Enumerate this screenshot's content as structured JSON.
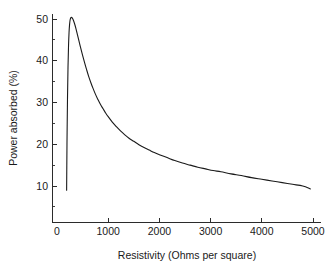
{
  "chart_data": {
    "type": "line",
    "title": "",
    "xlabel": "Resistivity (Ohms per square)",
    "ylabel": "Power absorbed (%)",
    "xlim": [
      0,
      5000
    ],
    "ylim": [
      0,
      53
    ],
    "grid": false,
    "legend": null,
    "xticks": [
      0,
      1000,
      2000,
      3000,
      4000,
      5000
    ],
    "xtick_labels": [
      "0",
      "1000",
      "2000",
      "3000",
      "4000",
      "5000"
    ],
    "xminor_step": 500,
    "yticks": [
      10,
      20,
      30,
      40,
      50
    ],
    "ytick_labels": [
      "10",
      "20",
      "30",
      "40",
      "50"
    ],
    "yminor_step": 5,
    "series": [
      {
        "name": "power absorbed",
        "x": [
          188,
          195,
          205,
          215,
          225,
          235,
          245,
          255,
          265,
          280,
          300,
          320,
          345,
          370,
          400,
          430,
          460,
          500,
          540,
          580,
          620,
          660,
          700,
          750,
          800,
          850,
          900,
          950,
          1000,
          1080,
          1160,
          1240,
          1320,
          1400,
          1500,
          1600,
          1700,
          1800,
          1900,
          2000,
          2150,
          2300,
          2450,
          2600,
          2750,
          2900,
          3050,
          3200,
          3400,
          3600,
          3800,
          4000,
          4200,
          4400,
          4600,
          4800,
          4950
        ],
        "y": [
          9.0,
          20.0,
          31.0,
          38.5,
          43.5,
          46.7,
          48.6,
          49.7,
          50.2,
          50.4,
          50.2,
          49.7,
          48.8,
          47.7,
          46.2,
          44.7,
          43.2,
          41.3,
          39.5,
          37.8,
          36.2,
          34.8,
          33.5,
          32.0,
          30.7,
          29.5,
          28.5,
          27.5,
          26.6,
          25.3,
          24.2,
          23.2,
          22.3,
          21.5,
          20.7,
          19.9,
          19.2,
          18.6,
          18.0,
          17.5,
          16.8,
          16.1,
          15.5,
          15.0,
          14.5,
          14.1,
          13.7,
          13.4,
          12.9,
          12.5,
          12.0,
          11.6,
          11.2,
          10.8,
          10.4,
          10.0,
          9.3
        ]
      }
    ],
    "annotations": {
      "peak_x": 280,
      "peak_y": 50.4,
      "asymptote_y": 9.3
    }
  },
  "axes": {
    "x_title": "Resistivity (Ohms per square)",
    "y_title": "Power absorbed (%)"
  }
}
